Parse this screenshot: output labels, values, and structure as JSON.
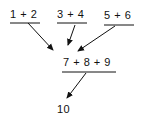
{
  "diagram": {
    "row1": [
      {
        "label": "1 + 2"
      },
      {
        "label": "3 + 4"
      },
      {
        "label": "5 + 6"
      }
    ],
    "row2": {
      "label": "7 + 8 + 9"
    },
    "result": {
      "label": "10"
    },
    "colors": {
      "ink": "#111111",
      "background": "#ffffff"
    }
  }
}
